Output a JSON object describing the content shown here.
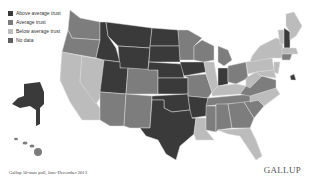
{
  "legend": {
    "items": [
      {
        "label": "Above average trust",
        "color": "#3a3a3a"
      },
      {
        "label": "Average trust",
        "color": "#7b7b7b"
      },
      {
        "label": "Below average trust",
        "color": "#bdbdbd"
      },
      {
        "label": "No data",
        "color": "#5e5e5e"
      }
    ]
  },
  "colors": {
    "above": "#3a3a3a",
    "average": "#7d7d7d",
    "below": "#bcbcbc",
    "background": "#ffffff"
  },
  "map": {
    "regions": {
      "above_average": [
        "Montana",
        "Idaho",
        "Wyoming",
        "North Dakota",
        "South Dakota",
        "Nebraska",
        "Utah",
        "Kansas",
        "Iowa",
        "Oklahoma",
        "Texas",
        "Arkansas",
        "Indiana",
        "Alaska",
        "New Hampshire"
      ],
      "average": [
        "Washington",
        "Oregon",
        "Colorado",
        "Arizona",
        "New Mexico",
        "Minnesota",
        "Wisconsin",
        "Missouri",
        "Ohio",
        "Michigan",
        "Tennessee",
        "Alabama",
        "Georgia",
        "South Carolina",
        "Mississippi",
        "Virginia",
        "Hawaii",
        "Kentucky"
      ],
      "below_average": [
        "California",
        "Nevada",
        "Illinois",
        "Louisiana",
        "Florida",
        "North Carolina",
        "West Virginia",
        "Pennsylvania",
        "New York",
        "Maine",
        "Vermont",
        "Massachusetts",
        "New Jersey",
        "Maryland",
        "Delaware",
        "Connecticut",
        "Rhode Island"
      ]
    }
  },
  "footer": {
    "source": "Gallup 50-state poll, June-December 2013",
    "brand": "GALLUP"
  }
}
